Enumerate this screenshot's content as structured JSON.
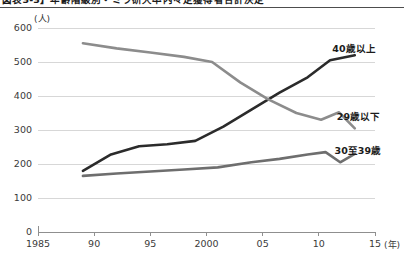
{
  "figure": {
    "caption": "図表3-3】年齢階級別・ミラ研大卒内々定獲得者合計決定",
    "unit_label_y": "(人)",
    "unit_label_x": "(年)"
  },
  "chart_data": {
    "type": "line",
    "title": "",
    "xlabel": "(年)",
    "ylabel": "(人)",
    "xlim": [
      1985,
      2015
    ],
    "ylim": [
      0,
      600
    ],
    "ytick_values": [
      0,
      100,
      200,
      300,
      400,
      500,
      600
    ],
    "ytick_labels": [
      "0",
      "100",
      "200",
      "300",
      "400",
      "500",
      "600"
    ],
    "xtick_values": [
      1985,
      1990,
      1995,
      2000,
      2005,
      2010,
      2015
    ],
    "xtick_labels": [
      "1985",
      "90",
      "95",
      "2000",
      "05",
      "10",
      "15"
    ],
    "grid": "horizontal",
    "legend_position": "right-inline",
    "series": [
      {
        "name": "40歳以上",
        "color": "#2b2b2b",
        "width": 2.6,
        "label_x": 2011.2,
        "label_y": 545,
        "x": [
          1989.0,
          1991.5,
          1994.0,
          1996.5,
          1999.0,
          2001.5,
          2004.0,
          2006.5,
          2009.0,
          2011.0,
          2013.2
        ],
        "y": [
          180,
          228,
          252,
          258,
          268,
          310,
          360,
          410,
          455,
          505,
          520
        ]
      },
      {
        "name": "29歳以下",
        "color": "#8c8c8c",
        "width": 2.6,
        "label_x": 2011.6,
        "label_y": 345,
        "x": [
          1989.0,
          1992.0,
          1995.0,
          1998.0,
          2000.5,
          2003.0,
          2005.5,
          2008.0,
          2010.2,
          2011.8,
          2013.2
        ],
        "y": [
          555,
          540,
          528,
          515,
          500,
          440,
          390,
          350,
          330,
          352,
          305
        ]
      },
      {
        "name": "30至39歳",
        "color": "#6e6e6e",
        "width": 2.6,
        "label_x": 2011.4,
        "label_y": 243,
        "x": [
          1989.0,
          1992.0,
          1995.0,
          1998.0,
          2001.0,
          2004.0,
          2006.5,
          2009.0,
          2010.6,
          2011.9,
          2013.2
        ],
        "y": [
          165,
          172,
          178,
          184,
          190,
          205,
          215,
          228,
          235,
          205,
          230
        ]
      }
    ]
  }
}
